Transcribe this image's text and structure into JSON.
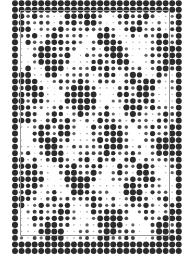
{
  "canvas": {
    "width": 187,
    "height": 265,
    "background_color": "#ffffff",
    "description": "halftone-dot-raster-image"
  },
  "halftone": {
    "grid": {
      "origin_x": 15.0,
      "origin_y": 3.2,
      "pitch_x": 6.55,
      "pitch_y": 6.52,
      "columns": 26,
      "rows": 39
    },
    "dot_color_dark": "#2b2b2b",
    "dot_color_mid": "#6e6e6e",
    "dot_color_light": "#c9c9c9",
    "max_radius": 3.05,
    "min_radius": 0.28,
    "shape": "circle",
    "band_top_rows": [
      0,
      1
    ],
    "band_bottom_rows": [
      37,
      38
    ],
    "density_map": [
      "99999999999999999999999999",
      "99999999999999999999999999",
      "9911000099999411009999911119",
      "99103009999200019999911199",
      "99100399991000099999111199",
      "99010999910000999991111999",
      "99019999100009999911119999",
      "99199991000099999111199999",
      "99999910000999991111999999",
      "99999100009999911119999999",
      "99991000099999111199999999",
      "99910000999991111999999999",
      "99100009999911119999999999",
      "91000099999111199999999999",
      "10000999991111999999999999",
      "00009999911119999999999999",
      "00999999111199999999999999",
      "09999991111999999999999999",
      "99999911119999999999999999",
      "99999111199999999999999999",
      "99991111999999999999999999",
      "99911119999999999999999999",
      "99111199999999999999999999",
      "91111999999999999999999999",
      "11119999999999999999999999",
      "11199999999999999999999999",
      "11999999999999999999999999",
      "19999999999999999999999999",
      "99999999999999999999999999",
      "99999999999999999999999999",
      "99999999999999999999999999",
      "99999999999999999999999999",
      "99999999999999999999999999",
      "99999999999999999999999999",
      "99999999999999999999999999",
      "99999999999999999999999999",
      "99999999999999999999999999",
      "99999999999999999999999999",
      "99999999999999999999999999"
    ]
  },
  "frame": {
    "left": 20,
    "top": 10,
    "width": 150,
    "height": 226,
    "border_color": "#9a9a9a",
    "border_width": 1,
    "label": "inset-rectangle-rule"
  }
}
